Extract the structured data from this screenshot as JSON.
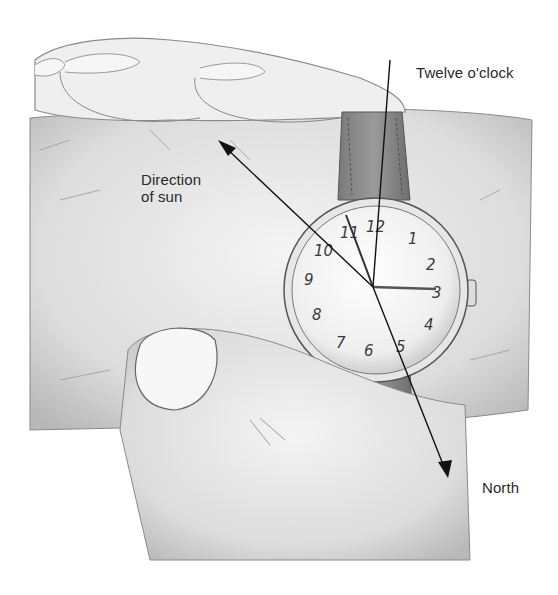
{
  "figure": {
    "labels": {
      "twelve": "Twelve o'clock",
      "sun_line1": "Direction",
      "sun_line2": "of sun",
      "north": "North"
    },
    "watch": {
      "numerals": [
        "12",
        "1",
        "2",
        "3",
        "4",
        "5",
        "6",
        "7",
        "8",
        "9",
        "10",
        "11"
      ],
      "hour_hand_points_to": "11",
      "minute_hand_points_to": "3"
    },
    "colors": {
      "ink": "#2a2a2a",
      "skin_shade": "#bdbdbd",
      "strap": "#8a8a8a",
      "background": "#ffffff"
    }
  }
}
